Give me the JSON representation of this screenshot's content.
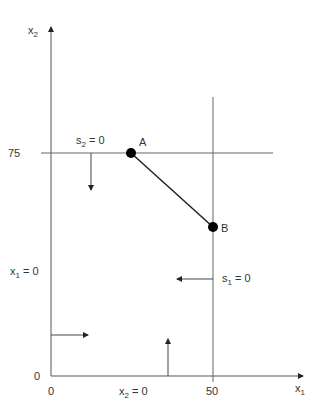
{
  "diagram": {
    "type": "linear-programming-feasible-region",
    "colors": {
      "axis": "#555555",
      "constraint": "#666666",
      "segment": "#222222",
      "point": "#000000",
      "text": "#333333"
    },
    "axes": {
      "x": {
        "label_base": "x",
        "label_sub": "1"
      },
      "y": {
        "label_base": "x",
        "label_sub": "2"
      },
      "origin_x_tick": "0",
      "origin_y_tick": "0"
    },
    "ticks": {
      "x_50": "50",
      "y_75": "75"
    },
    "points": [
      {
        "id": "A",
        "label": "A",
        "x1": 25,
        "x2": 75
      },
      {
        "id": "B",
        "label": "B",
        "x1": 50,
        "x2": 50
      }
    ],
    "constraints": [
      {
        "id": "s2",
        "label_base": "s",
        "label_sub": "2",
        "label_rest": " = 0",
        "line": "x2 = 75",
        "arrow": "down"
      },
      {
        "id": "s1",
        "label_base": "s",
        "label_sub": "1",
        "label_rest": " = 0",
        "line": "x1 = 50",
        "arrow": "left"
      },
      {
        "id": "x1",
        "label_base": "x",
        "label_sub": "1",
        "label_rest": " = 0",
        "line": "x1 = 0",
        "arrow": "right"
      },
      {
        "id": "x2",
        "label_base": "x",
        "label_sub": "2",
        "label_rest": " = 0",
        "line": "x2 = 0",
        "arrow": "up"
      }
    ]
  }
}
